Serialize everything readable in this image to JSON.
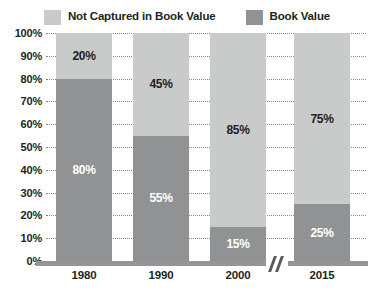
{
  "chart_data": {
    "type": "bar",
    "subtype": "stacked-100-percent",
    "title": "",
    "xlabel": "",
    "ylabel": "",
    "categories": [
      "1980",
      "1990",
      "2000",
      "2015"
    ],
    "series": [
      {
        "name": "Not Captured in Book Value",
        "color": "#c9caca",
        "values": [
          20,
          45,
          85,
          75
        ],
        "labels": [
          "20%",
          "45%",
          "85%",
          "75%"
        ]
      },
      {
        "name": "Book Value",
        "color": "#919294",
        "values": [
          80,
          55,
          15,
          25
        ],
        "labels": [
          "80%",
          "55%",
          "15%",
          "25%"
        ]
      }
    ],
    "ylim": [
      0,
      100
    ],
    "ytick_values": [
      0,
      10,
      20,
      30,
      40,
      50,
      60,
      70,
      80,
      90,
      100
    ],
    "ytick_labels": [
      "0%",
      "10%",
      "20%",
      "30%",
      "40%",
      "50%",
      "60%",
      "70%",
      "80%",
      "90%",
      "100%"
    ],
    "grid": true,
    "grid_style": "dotted",
    "legend_position": "top-center",
    "axis_break": {
      "present": true,
      "between": [
        "2000",
        "2015"
      ],
      "icon": "axis-break-icon"
    }
  },
  "legend": {
    "entries": [
      {
        "label": "Not Captured in Book Value",
        "swatch": "legend-swatch-light"
      },
      {
        "label": "Book Value",
        "swatch": "legend-swatch-dark"
      }
    ]
  },
  "colors": {
    "light_gray": "#c9caca",
    "dark_gray": "#919294",
    "axis": "#939598",
    "grid": "#8a8a8a",
    "text": "#231f20",
    "label_on_dark": "#ffffff",
    "background": "#ffffff"
  }
}
